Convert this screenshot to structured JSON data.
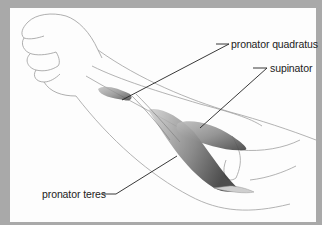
{
  "figure": {
    "background_frame_color": "#a9a9a9",
    "panel_color": "#fdfdfd",
    "labels": [
      {
        "id": "pronator-quadratus",
        "text": "pronator quadratus"
      },
      {
        "id": "supinator",
        "text": "supinator"
      },
      {
        "id": "pronator-teres",
        "text": "pronator teres"
      }
    ]
  }
}
